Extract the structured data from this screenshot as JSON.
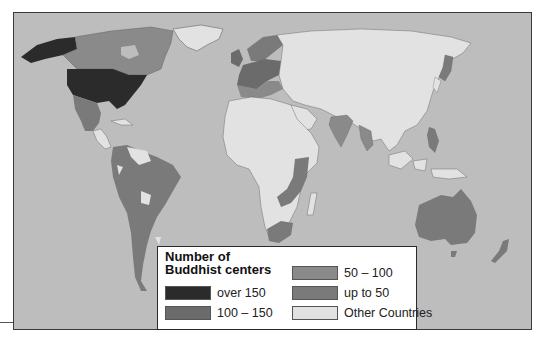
{
  "map": {
    "title": "Number of Buddhist centers",
    "ocean_color": "#bdbdbd",
    "legend": {
      "title_line1": "Number of",
      "title_line2": "Buddhist centers",
      "items": [
        {
          "label": "over 150",
          "color": "#2b2b2b"
        },
        {
          "label": "100 – 150",
          "color": "#6b6b6b"
        },
        {
          "label": "50 – 100",
          "color": "#8a8a8a"
        },
        {
          "label": "up to 50",
          "color": "#7a7a7a"
        },
        {
          "label": "Other Countries",
          "color": "#e2e2e2"
        }
      ]
    },
    "regions": [
      {
        "name": "United States",
        "category": "over 150"
      },
      {
        "name": "Canada",
        "category": "50 – 100"
      },
      {
        "name": "Mexico",
        "category": "up to 50"
      },
      {
        "name": "United Kingdom",
        "category": "100 – 150"
      },
      {
        "name": "Western Europe",
        "category": "100 – 150"
      },
      {
        "name": "Scandinavia",
        "category": "up to 50"
      },
      {
        "name": "South America",
        "category": "up to 50"
      },
      {
        "name": "Southern Africa",
        "category": "up to 50"
      },
      {
        "name": "India",
        "category": "up to 50"
      },
      {
        "name": "Japan",
        "category": "up to 50"
      },
      {
        "name": "Philippines",
        "category": "up to 50"
      },
      {
        "name": "Australia",
        "category": "up to 50"
      },
      {
        "name": "New Zealand",
        "category": "up to 50"
      },
      {
        "name": "Russia / Asia",
        "category": "Other Countries"
      },
      {
        "name": "Africa",
        "category": "Other Countries"
      },
      {
        "name": "Greenland",
        "category": "Other Countries"
      }
    ]
  }
}
